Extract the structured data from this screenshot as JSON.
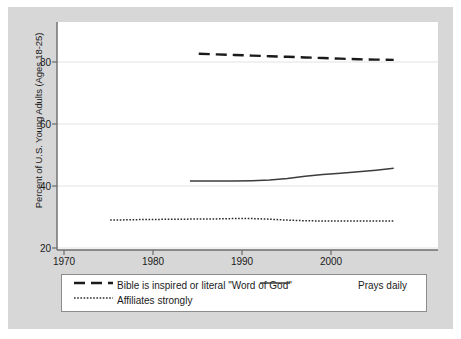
{
  "chart_data": {
    "type": "line",
    "title": "",
    "subtitle": "",
    "xlabel": "",
    "ylabel": "Percent of U.S. Young Adults (Ages 18-25)",
    "xlim": [
      1968,
      2011
    ],
    "ylim": [
      18,
      92
    ],
    "xticks": [
      "1970",
      "1980",
      "1990",
      "2000"
    ],
    "xtick_values": [
      1970,
      1980,
      1990,
      2000
    ],
    "yticks": [
      "20",
      "40",
      "60",
      "80"
    ],
    "ytick_values": [
      20,
      40,
      60,
      80
    ],
    "grid": "horizontal",
    "legend_position": "below-axes",
    "series": [
      {
        "name": "Bible is inspired or literal \"Word of God\"",
        "style": "long-dash",
        "color": "#1a1a1a",
        "x": [
          1984,
          1986,
          1988,
          1990,
          1992,
          1994,
          1996,
          1998,
          2000,
          2002,
          2004,
          2006
        ],
        "values": [
          81.7,
          81.5,
          81.3,
          81.1,
          80.9,
          80.7,
          80.5,
          80.3,
          80.1,
          79.9,
          79.8,
          79.7
        ]
      },
      {
        "name": "Prays daily",
        "style": "solid",
        "color": "#3c3c3c",
        "x": [
          1983,
          1986,
          1988,
          1990,
          1992,
          1994,
          1996,
          1998,
          2000,
          2002,
          2004,
          2006
        ],
        "values": [
          40.4,
          40.4,
          40.4,
          40.5,
          40.7,
          41.2,
          41.9,
          42.5,
          42.9,
          43.4,
          43.9,
          44.5
        ]
      },
      {
        "name": "Affiliates strongly",
        "style": "dotted",
        "color": "#2b2b2b",
        "x": [
          1974,
          1978,
          1982,
          1986,
          1988,
          1990,
          1992,
          1994,
          1996,
          1998,
          2000,
          2002,
          2004,
          2006
        ],
        "values": [
          27.7,
          27.9,
          28.0,
          28.1,
          28.2,
          28.2,
          28.0,
          27.7,
          27.5,
          27.4,
          27.4,
          27.4,
          27.4,
          27.4
        ]
      }
    ]
  },
  "legend": {
    "entries": [
      {
        "label": "Bible is inspired or literal \"Word of God\"",
        "style": "long-dash"
      },
      {
        "label": "Prays daily",
        "style": "solid"
      },
      {
        "label": "Affiliates strongly",
        "style": "dotted"
      }
    ]
  },
  "axes": {
    "ylabel": "Percent of U.S. Young Adults (Ages 18-25)",
    "yticks": [
      "20",
      "40",
      "60",
      "80"
    ],
    "xticks": [
      "1970",
      "1980",
      "1990",
      "2000"
    ]
  }
}
